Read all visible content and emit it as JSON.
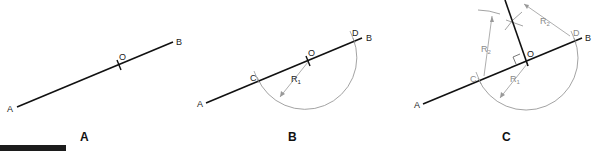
{
  "colors": {
    "line": "#111111",
    "construction": "#999999",
    "label_gray": "#8a8a8a",
    "background": "#ffffff"
  },
  "panels": [
    {
      "id": "A",
      "title": "A",
      "points": {
        "A": "A",
        "B": "B",
        "O": "O"
      }
    },
    {
      "id": "B",
      "title": "B",
      "points": {
        "A": "A",
        "B": "B",
        "O": "O",
        "C": "C",
        "D": "D"
      },
      "radius_label": "R",
      "radius_sub": "1"
    },
    {
      "id": "C",
      "title": "C",
      "points": {
        "A": "A",
        "B": "B",
        "O": "O",
        "C": "C",
        "D": "D"
      },
      "radius1_label": "R",
      "radius1_sub": "1",
      "radius2_label_left": "R",
      "radius2_sub_left": "2",
      "radius2_label_right": "R",
      "radius2_sub_right": "2"
    }
  ]
}
